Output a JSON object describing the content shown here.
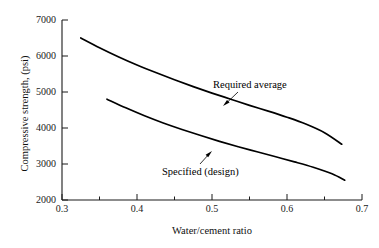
{
  "chart_data": {
    "type": "line",
    "title": "",
    "xlabel": "Water/cement ratio",
    "ylabel": "Compressive strength,  (psi)",
    "xlim": [
      0.3,
      0.7
    ],
    "ylim": [
      2000,
      7000
    ],
    "xticks": [
      "0.3",
      "0.4",
      "0.5",
      "0.6",
      "0.7"
    ],
    "xtick_values": [
      0.3,
      0.4,
      0.5,
      0.6,
      0.7
    ],
    "xminor_ticks": [
      0.35,
      0.45,
      0.55,
      0.65
    ],
    "yticks": [
      "2000",
      "3000",
      "4000",
      "5000",
      "6000",
      "7000"
    ],
    "ytick_values": [
      2000,
      3000,
      4000,
      5000,
      6000,
      7000
    ],
    "grid": false,
    "legend": "inline-annotations",
    "series": [
      {
        "name": "Required average",
        "x": [
          0.325,
          0.35,
          0.375,
          0.4,
          0.425,
          0.45,
          0.475,
          0.5,
          0.525,
          0.55,
          0.575,
          0.6,
          0.625,
          0.65,
          0.673
        ],
        "values": [
          6500,
          6230,
          5980,
          5750,
          5540,
          5340,
          5150,
          4970,
          4800,
          4630,
          4470,
          4300,
          4110,
          3870,
          3550
        ]
      },
      {
        "name": "Specified (design)",
        "x": [
          0.36,
          0.385,
          0.41,
          0.435,
          0.46,
          0.485,
          0.51,
          0.535,
          0.56,
          0.585,
          0.61,
          0.635,
          0.66,
          0.677
        ],
        "values": [
          4800,
          4560,
          4340,
          4140,
          3960,
          3790,
          3630,
          3480,
          3340,
          3200,
          3060,
          2910,
          2730,
          2550
        ]
      }
    ],
    "annotations": [
      {
        "text": "Required average",
        "label_x": 213,
        "label_y": 79,
        "arrow_from_x": 238,
        "arrow_from_y": 92,
        "arrow_to_x": 224,
        "arrow_to_y": 105
      },
      {
        "text": "Specified (design)",
        "label_x": 162,
        "label_y": 166,
        "arrow_from_x": 200,
        "arrow_from_y": 164,
        "arrow_to_x": 211,
        "arrow_to_y": 151
      }
    ],
    "line_color": "#000000",
    "axis_color": "#1a1a1a",
    "background": "#ffffff"
  }
}
